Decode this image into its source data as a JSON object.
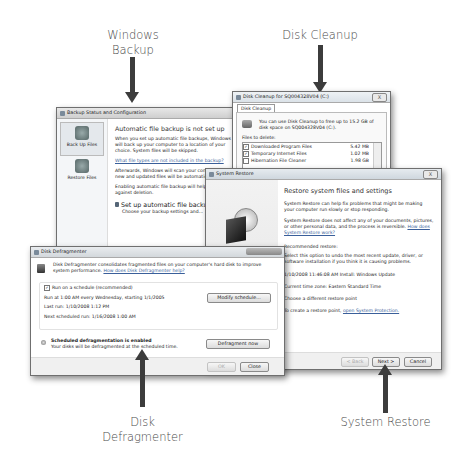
{
  "labels": {
    "windows_backup": [
      "Windows",
      "Backup"
    ],
    "disk_cleanup": "Disk Cleanup",
    "disk_defragmenter": [
      "Disk",
      "Defragmenter"
    ],
    "system_restore": "System Restore"
  },
  "backup": {
    "title": "Backup Status and Configuration",
    "sidebar": [
      {
        "label": "Back Up Files",
        "icon": "backup-files-icon"
      },
      {
        "label": "Restore Files",
        "icon": "restore-files-icon"
      }
    ],
    "heading": "Automatic file backup is not set up",
    "para1": "When you set up automatic file backups, Windows will back up your computer to a location of your choice. System files will be skipped.",
    "link": "What file types are not included in the backup?",
    "para2": "Afterwards, Windows will scan your computer and new and updated files will be automatically added.",
    "para3": "Enabling automatic file backup will help protect against deletion.",
    "setup_label": "Set up automatic file backup",
    "setup_sub": "Choose your backup settings and..."
  },
  "cleanup": {
    "title": "Disk Cleanup for SQ004328V04 (C:)",
    "close": "X",
    "tab": "Disk Cleanup",
    "intro": "You can use Disk Cleanup to free up to 15.2 GB of disk space on SQ004328V04 (C:).",
    "files_label": "Files to delete:",
    "files": [
      {
        "name": "Downloaded Program Files",
        "size": "5.42 MB",
        "checked": true
      },
      {
        "name": "Temporary Internet Files",
        "size": "1.02 MB",
        "checked": true
      },
      {
        "name": "Hibernation File Cleaner",
        "size": "1.98 GB",
        "checked": false
      }
    ]
  },
  "restore": {
    "title": "System Restore",
    "close": "X",
    "heading": "Restore system files and settings",
    "para1": "System Restore can help fix problems that might be making your computer run slowly or stop responding.",
    "para2": "System Restore does not affect any of your documents, pictures, or other personal data, and the process is reversible.",
    "para2_link": "How does System Restore work?",
    "option1": "Recommended restore:",
    "option1_desc": "Select this option to undo the most recent update, driver, or software installation if you think it is causing problems.",
    "restore_point": "1/10/2008 11:46:08 AM  Install: Windows Update",
    "timezone": "Current time zone: Eastern Standard Time",
    "option2": "Choose a different restore point",
    "create_text": "To create a restore point,",
    "create_link": "open System Protection.",
    "buttons": {
      "back": "< Back",
      "next": "Next >",
      "cancel": "Cancel"
    }
  },
  "defrag": {
    "title": "Disk Defragmenter",
    "intro": "Disk Defragmenter consolidates fragmented files on your computer's hard disk to improve system performance.",
    "intro_link": "How does Disk Defragmenter help?",
    "schedule_checkbox": "Run on a schedule (recommended)",
    "schedule_checked": true,
    "run_at": "Run at 1:00 AM every Wednesday, starting 1/1/2005",
    "last_run": "Last run: 1/10/2008 1:12 PM",
    "next_run": "Next scheduled run: 1/16/2008 1:00 AM",
    "modify_button": "Modify schedule...",
    "status_title": "Scheduled defragmentation is enabled",
    "status_desc": "Your disks will be defragmented at the scheduled time.",
    "defrag_button": "Defragment now",
    "ok": "OK",
    "close": "Close"
  }
}
